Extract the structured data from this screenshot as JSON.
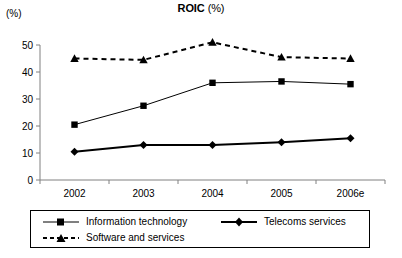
{
  "chart_data": {
    "type": "line",
    "title_main": "ROIC",
    "title_sub": "(%)",
    "ylabel": "(%)",
    "xlabel": "",
    "categories": [
      "2002",
      "2003",
      "2004",
      "2005",
      "2006e"
    ],
    "ylim": [
      0,
      50
    ],
    "yticks": [
      0,
      10,
      20,
      30,
      40,
      50
    ],
    "ytick_labels": [
      "0",
      "10",
      "20",
      "30",
      "40",
      "50"
    ],
    "grid": false,
    "legend_position": "bottom",
    "series": [
      {
        "name": "Information technology",
        "values": [
          20.5,
          27.5,
          36.0,
          36.5,
          35.5
        ],
        "marker": "square",
        "line_style": "solid",
        "line_width": 1,
        "color": "#000000"
      },
      {
        "name": "Telecoms services",
        "values": [
          10.5,
          13.0,
          13.0,
          14.0,
          15.5
        ],
        "marker": "diamond",
        "line_style": "solid",
        "line_width": 2,
        "color": "#000000"
      },
      {
        "name": "Software and services",
        "values": [
          45.0,
          44.5,
          51.0,
          45.5,
          45.0
        ],
        "marker": "triangle",
        "line_style": "dashed",
        "line_width": 2,
        "color": "#000000"
      }
    ]
  },
  "legend": {
    "entries": [
      {
        "label": "Information technology"
      },
      {
        "label": "Telecoms services"
      },
      {
        "label": "Software and services"
      }
    ]
  },
  "colors": {
    "ink": "#000000",
    "axis": "#808080",
    "background": "#ffffff"
  }
}
